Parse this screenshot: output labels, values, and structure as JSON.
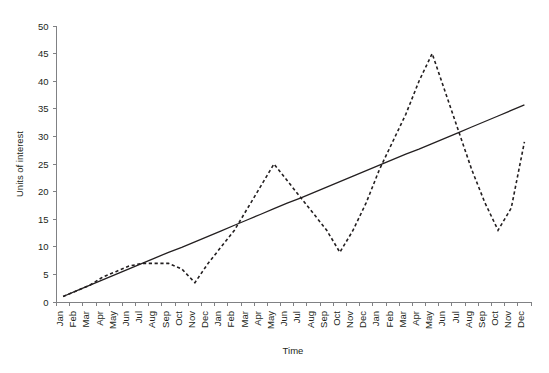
{
  "chart_data": {
    "type": "line",
    "title": "",
    "xlabel": "Time",
    "ylabel": "Units of interest",
    "ylim": [
      0,
      50
    ],
    "ytick_step": 5,
    "yticks": [
      0,
      5,
      10,
      15,
      20,
      25,
      30,
      35,
      40,
      45,
      50
    ],
    "grid": false,
    "legend": "none",
    "categories": [
      "Jan",
      "Feb",
      "Mar",
      "Apr",
      "May",
      "Jun",
      "Jul",
      "Aug",
      "Sep",
      "Oct",
      "Nov",
      "Dec",
      "Jan",
      "Feb",
      "Mar",
      "Apr",
      "May",
      "Jun",
      "Jul",
      "Aug",
      "Sep",
      "Oct",
      "Nov",
      "Dec",
      "Jan",
      "Feb",
      "Mar",
      "Apr",
      "May",
      "Jun",
      "Jul",
      "Aug",
      "Sep",
      "Oct",
      "Nov",
      "Dec"
    ],
    "series": [
      {
        "name": "Units of interest",
        "style": "dashed",
        "color": "#231f20",
        "values": [
          1,
          2,
          3,
          4.5,
          5.5,
          6.5,
          7,
          7,
          7,
          6,
          3.5,
          7,
          10,
          13,
          17,
          21,
          25,
          22,
          19,
          16,
          13,
          9,
          13,
          18,
          24,
          29,
          34,
          40,
          45,
          38,
          31,
          24,
          18,
          13,
          17,
          29
        ]
      },
      {
        "name": "Trend",
        "style": "solid",
        "color": "#231f20",
        "values": [
          1.0,
          2.0,
          3.0,
          4.0,
          5.0,
          6.0,
          7.0,
          8.0,
          9.0,
          9.9,
          10.9,
          11.9,
          12.9,
          13.9,
          14.9,
          15.9,
          16.9,
          17.9,
          18.8,
          19.8,
          20.8,
          21.8,
          22.8,
          23.8,
          24.8,
          25.8,
          26.8,
          27.7,
          28.7,
          29.7,
          30.7,
          31.7,
          32.7,
          33.7,
          34.7,
          35.7
        ]
      }
    ]
  }
}
